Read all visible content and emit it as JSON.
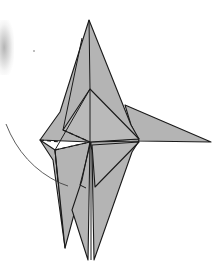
{
  "diagram": {
    "colors": {
      "paper_fill": "#b4b4b4",
      "paper_fill_light": "#bdbdbd",
      "fold_line": "#1a1a1a",
      "arrow_line": "#333333",
      "background": "#ffffff"
    },
    "line_styles": {
      "valley_fold": "dashed",
      "edge": "solid",
      "motion_arrow": "thin curved"
    },
    "annotations": {
      "fold_arrow": "curved arrow from left sweeping down toward lower-left flap"
    }
  }
}
